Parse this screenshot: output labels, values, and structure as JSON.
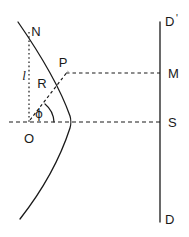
{
  "figure": {
    "background_color": "#ffffff",
    "stroke_color": "#1a1a1a",
    "width": 189,
    "height": 237
  },
  "labels": {
    "vertex_top": "N",
    "point_on_curve": "P",
    "origin": "O",
    "screen_mid": "M",
    "screen_axis": "S",
    "screen_bottom": "D",
    "screen_top": "D",
    "screen_top_prime": "'",
    "height_l": "l",
    "radius_R": "R",
    "angle_phi": "ϕ"
  },
  "elements": {
    "curve_name": "parabolic-mirror-curve",
    "vertical_line_name": "detector-plane-line",
    "axis_name": "optical-axis-dashed",
    "ray_name": "radius-ray-dashed",
    "height_line_name": "height-dotted-line",
    "projection_name": "p-to-m-dashed-line",
    "arc_name": "angle-arc"
  },
  "geometry": {
    "origin_xy": [
      29,
      122
    ],
    "point_p_xy": [
      68,
      74
    ],
    "point_n_xy": [
      29,
      32
    ],
    "plane_x": 160,
    "plane_y_top": 22,
    "plane_y_bottom": 222,
    "axis_y": 122,
    "projection_y": 73
  }
}
